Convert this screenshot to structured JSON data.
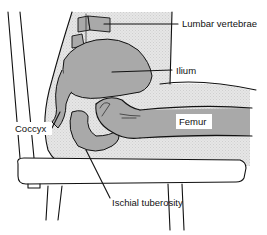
{
  "diagram": {
    "type": "anatomical-illustration",
    "labels": {
      "lumbar_vertebrae": "Lumbar vertebrae",
      "ilium": "Ilium",
      "femur": "Femur",
      "coccyx": "Coccyx",
      "ischial_tuberosity": "Ischial tuberosity"
    },
    "colors": {
      "background": "#ffffff",
      "body_fill": "#e4e4e4",
      "bone_fill": "#a9a9a9",
      "outline": "#111111",
      "label_bg": "#ffffff"
    }
  }
}
